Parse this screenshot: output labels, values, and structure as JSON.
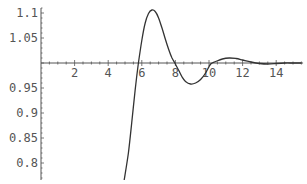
{
  "chart_data": {
    "type": "line",
    "title": "",
    "xlabel": "",
    "ylabel": "",
    "xlim": [
      0,
      15.6
    ],
    "ylim": [
      0.766,
      1.11
    ],
    "axes_origin": {
      "x": 0,
      "y": 1.0
    },
    "grid": false,
    "legend": null,
    "x_ticks": [
      2,
      4,
      6,
      8,
      10,
      12,
      14
    ],
    "x_tick_labels": [
      "2",
      "4",
      "6",
      "8",
      "10",
      "12",
      "14"
    ],
    "y_ticks": [
      0.8,
      0.85,
      0.9,
      0.95,
      1.05,
      1.1
    ],
    "y_tick_labels": [
      "0.8",
      "0.85",
      "0.9",
      "0.95",
      "1.05",
      "1.1"
    ],
    "series": [
      {
        "name": "response",
        "color": "#333333",
        "points": [
          [
            4.95,
            0.766
          ],
          [
            5.2,
            0.82
          ],
          [
            5.4,
            0.88
          ],
          [
            5.6,
            0.945
          ],
          [
            5.8,
            1.0
          ],
          [
            6.0,
            1.045
          ],
          [
            6.2,
            1.08
          ],
          [
            6.4,
            1.099
          ],
          [
            6.6,
            1.106
          ],
          [
            6.8,
            1.103
          ],
          [
            7.0,
            1.09
          ],
          [
            7.2,
            1.07
          ],
          [
            7.4,
            1.048
          ],
          [
            7.6,
            1.027
          ],
          [
            7.8,
            1.01
          ],
          [
            8.0,
            0.998
          ],
          [
            8.2,
            0.985
          ],
          [
            8.4,
            0.972
          ],
          [
            8.6,
            0.963
          ],
          [
            8.9,
            0.958
          ],
          [
            9.2,
            0.96
          ],
          [
            9.5,
            0.967
          ],
          [
            9.8,
            0.98
          ],
          [
            10.1,
            0.998
          ],
          [
            10.4,
            1.003
          ],
          [
            10.8,
            1.008
          ],
          [
            11.2,
            1.01
          ],
          [
            11.6,
            1.009
          ],
          [
            12.0,
            1.006
          ],
          [
            12.5,
            1.002
          ],
          [
            13.0,
            0.999
          ],
          [
            13.5,
            0.998
          ],
          [
            14.0,
            0.999
          ],
          [
            14.5,
            1.0
          ],
          [
            15.0,
            1.0
          ],
          [
            15.5,
            1.0
          ]
        ]
      }
    ]
  },
  "layout": {
    "px_origin_x": 41,
    "px_per_x": 16.8,
    "px_y_at_1": 63,
    "px_per_y": 500
  },
  "colors": {
    "axis": "#555555",
    "curve": "#333333",
    "background": "#ffffff"
  }
}
